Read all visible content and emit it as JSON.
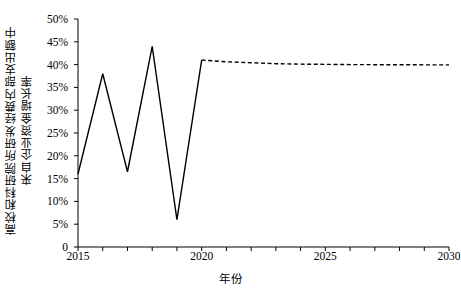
{
  "chart_data": {
    "type": "line",
    "title": "",
    "xlabel": "年份",
    "ylabel_line1": "高校和科研院所研发经费内部支出额中",
    "ylabel_line2": "来自企业资金增长率",
    "xlim": [
      2015,
      2030
    ],
    "ylim": [
      0,
      0.5
    ],
    "ytick_labels": [
      "50%",
      "45%",
      "40%",
      "35%",
      "30%",
      "25%",
      "20%",
      "15%",
      "10%",
      "5%",
      "0"
    ],
    "ytick_values": [
      0.5,
      0.45,
      0.4,
      0.35,
      0.3,
      0.25,
      0.2,
      0.15,
      0.1,
      0.05,
      0
    ],
    "xtick_labels": [
      "2015",
      "2020",
      "2025",
      "2030"
    ],
    "xtick_values": [
      2015,
      2020,
      2025,
      2030
    ],
    "xminor_step": 1,
    "grid": false,
    "legend": "none",
    "line_color": "#000000",
    "series": [
      {
        "name": "历史值",
        "style": "solid",
        "x": [
          2015,
          2016,
          2017,
          2018,
          2019,
          2020
        ],
        "values": [
          0.16,
          0.38,
          0.165,
          0.44,
          0.06,
          0.41
        ]
      },
      {
        "name": "预测值",
        "style": "dashed",
        "x": [
          2020,
          2021,
          2022,
          2023,
          2024,
          2025,
          2026,
          2027,
          2028,
          2029,
          2030
        ],
        "values": [
          0.41,
          0.406,
          0.404,
          0.402,
          0.401,
          0.4005,
          0.4,
          0.3998,
          0.3996,
          0.3995,
          0.3995
        ]
      }
    ]
  }
}
